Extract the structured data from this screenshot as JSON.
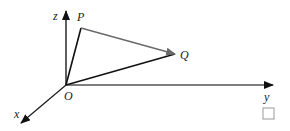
{
  "diagram": {
    "type": "3d-coordinate-vectors",
    "axes": {
      "x": {
        "label": "x"
      },
      "y": {
        "label": "y"
      },
      "z": {
        "label": "z"
      }
    },
    "points": {
      "origin": {
        "label": "O"
      },
      "P": {
        "label": "P"
      },
      "Q": {
        "label": "Q"
      }
    },
    "segments": [
      {
        "from": "O",
        "to": "P",
        "style": "line"
      },
      {
        "from": "O",
        "to": "Q",
        "style": "line"
      },
      {
        "from": "P",
        "to": "Q",
        "style": "arrow"
      }
    ],
    "colors": {
      "axis": "#1a1a1a",
      "y_axis": "#555555",
      "vector_OP_OQ": "#111111",
      "vector_PQ": "#6a6a6a",
      "checkbox_border": "#999999"
    }
  },
  "answer_box": {
    "checked": false
  }
}
